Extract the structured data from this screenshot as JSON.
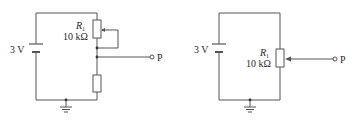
{
  "figure": {
    "circuits": [
      {
        "id": "left",
        "battery_label": "3 V",
        "resistor_name": "R",
        "resistor_subscript": "1",
        "resistor_value": "10 kΩ",
        "output_label": "P",
        "description": "Potentiometer R1 with wiper shorted to lower end, in series with fixed resistor; output P taken from junction"
      },
      {
        "id": "right",
        "battery_label": "3 V",
        "resistor_name": "R",
        "resistor_subscript": "1",
        "resistor_value": "10 kΩ",
        "output_label": "P",
        "description": "Potentiometer R1 across battery; output P taken from wiper"
      }
    ],
    "colors": {
      "wire": "#555555",
      "text": "#2a2a2a",
      "background": "#ffffff"
    }
  }
}
